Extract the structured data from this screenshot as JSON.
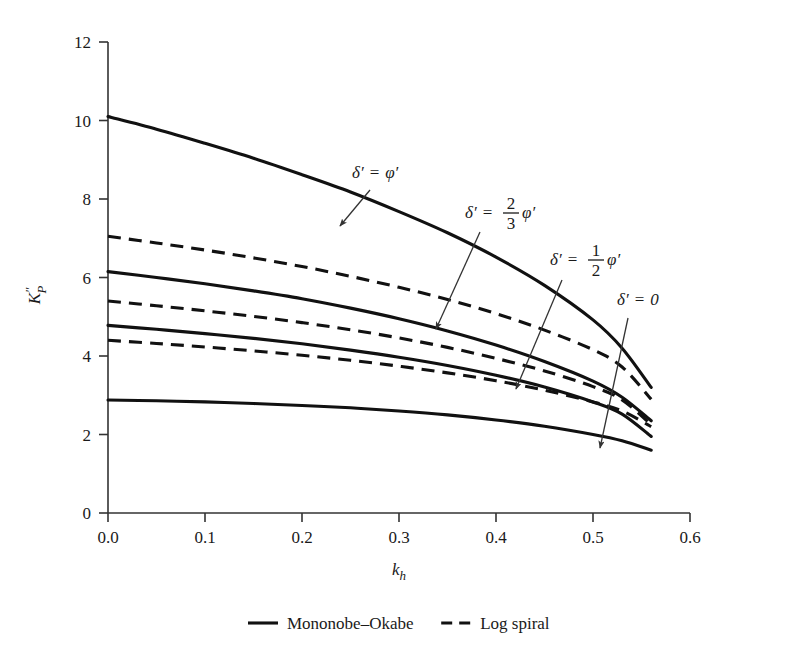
{
  "chart_data": {
    "type": "line",
    "title": "",
    "xlabel": "k_h",
    "ylabel": "K''_P",
    "xlim": [
      0.0,
      0.6
    ],
    "ylim": [
      0,
      12
    ],
    "grid": false,
    "xticks": [
      "0.0",
      "0.1",
      "0.2",
      "0.3",
      "0.4",
      "0.5",
      "0.6"
    ],
    "xtick_values": [
      0.0,
      0.1,
      0.2,
      0.3,
      0.4,
      0.5,
      0.6
    ],
    "yticks": [
      "0",
      "2",
      "4",
      "6",
      "8",
      "10",
      "12"
    ],
    "ytick_values": [
      0,
      2,
      4,
      6,
      8,
      10,
      12
    ],
    "legend_position": "bottom-outside",
    "legend": [
      {
        "label": "Mononobe–Okabe",
        "style": "solid"
      },
      {
        "label": "Log spiral",
        "style": "dashed"
      }
    ],
    "series": [
      {
        "name": "delta' = phi' (Mononobe-Okabe)",
        "style": "solid",
        "group": "delta' = phi'",
        "x": [
          0.0,
          0.05,
          0.1,
          0.15,
          0.2,
          0.25,
          0.3,
          0.35,
          0.4,
          0.45,
          0.5,
          0.53,
          0.56
        ],
        "y": [
          10.1,
          9.78,
          9.42,
          9.04,
          8.62,
          8.18,
          7.68,
          7.14,
          6.52,
          5.8,
          4.92,
          4.2,
          3.2
        ]
      },
      {
        "name": "delta' = phi' (Log spiral)",
        "style": "dashed",
        "group": "delta' = phi'",
        "x": [
          0.0,
          0.05,
          0.1,
          0.15,
          0.2,
          0.25,
          0.3,
          0.35,
          0.4,
          0.45,
          0.5,
          0.53,
          0.56
        ],
        "y": [
          7.05,
          6.88,
          6.7,
          6.5,
          6.28,
          6.03,
          5.75,
          5.44,
          5.08,
          4.66,
          4.16,
          3.72,
          2.9
        ]
      },
      {
        "name": "delta' = 2/3 phi' (Mononobe-Okabe)",
        "style": "solid",
        "group": "delta' = 2/3 phi'",
        "x": [
          0.0,
          0.05,
          0.1,
          0.15,
          0.2,
          0.25,
          0.3,
          0.35,
          0.4,
          0.45,
          0.5,
          0.53,
          0.56
        ],
        "y": [
          6.15,
          6.0,
          5.84,
          5.66,
          5.46,
          5.22,
          4.95,
          4.64,
          4.28,
          3.86,
          3.36,
          2.95,
          2.35
        ]
      },
      {
        "name": "delta' = 2/3 phi' (Log spiral)",
        "style": "dashed",
        "group": "delta' = 2/3 phi'",
        "x": [
          0.0,
          0.05,
          0.1,
          0.15,
          0.2,
          0.25,
          0.3,
          0.35,
          0.4,
          0.45,
          0.5,
          0.53,
          0.56
        ],
        "y": [
          5.4,
          5.28,
          5.15,
          5.01,
          4.85,
          4.67,
          4.46,
          4.22,
          3.94,
          3.62,
          3.22,
          2.88,
          2.25
        ]
      },
      {
        "name": "delta' = 1/2 phi' (Mononobe-Okabe)",
        "style": "solid",
        "group": "delta' = 1/2 phi'",
        "x": [
          0.0,
          0.05,
          0.1,
          0.15,
          0.2,
          0.25,
          0.3,
          0.35,
          0.4,
          0.45,
          0.5,
          0.53,
          0.56
        ],
        "y": [
          4.78,
          4.68,
          4.57,
          4.45,
          4.31,
          4.15,
          3.97,
          3.76,
          3.51,
          3.21,
          2.83,
          2.52,
          1.95
        ]
      },
      {
        "name": "delta' = 1/2 phi' (Log spiral)",
        "style": "dashed",
        "group": "delta' = 1/2 phi'",
        "x": [
          0.0,
          0.05,
          0.1,
          0.15,
          0.2,
          0.25,
          0.3,
          0.35,
          0.4,
          0.45,
          0.5,
          0.53,
          0.56
        ],
        "y": [
          4.4,
          4.32,
          4.23,
          4.13,
          4.02,
          3.89,
          3.74,
          3.57,
          3.37,
          3.13,
          2.83,
          2.6,
          2.2
        ]
      },
      {
        "name": "delta' = 0 (Mononobe-Okabe)",
        "style": "solid",
        "group": "delta' = 0",
        "x": [
          0.0,
          0.05,
          0.1,
          0.15,
          0.2,
          0.25,
          0.3,
          0.35,
          0.4,
          0.45,
          0.5,
          0.53,
          0.56
        ],
        "y": [
          2.88,
          2.86,
          2.83,
          2.79,
          2.74,
          2.68,
          2.6,
          2.5,
          2.37,
          2.21,
          2.0,
          1.84,
          1.6
        ]
      }
    ],
    "annotations": [
      {
        "id": "ann-delta-phi",
        "text": "δ′ = φ′",
        "kind": "plain",
        "label_x": 352,
        "label_y": 178,
        "arrow_from_x": 370,
        "arrow_from_y": 190,
        "arrow_to_x": 340,
        "arrow_to_y": 226
      },
      {
        "id": "ann-delta-2-3-phi",
        "text": "δ′ = 2/3 φ′",
        "kind": "fraction",
        "numerator": "2",
        "denominator": "3",
        "label_x": 465,
        "label_y": 218,
        "arrow_from_x": 480,
        "arrow_from_y": 232,
        "arrow_to_x": 436,
        "arrow_to_y": 329
      },
      {
        "id": "ann-delta-1-2-phi",
        "text": "δ′ = 1/2 φ′",
        "kind": "fraction",
        "numerator": "1",
        "denominator": "2",
        "label_x": 550,
        "label_y": 265,
        "arrow_from_x": 562,
        "arrow_from_y": 280,
        "arrow_to_x": 516,
        "arrow_to_y": 389
      },
      {
        "id": "ann-delta-0",
        "text": "δ′ = 0",
        "kind": "plain",
        "label_x": 617,
        "label_y": 305,
        "arrow_from_x": 628,
        "arrow_from_y": 318,
        "arrow_to_x": 600,
        "arrow_to_y": 448
      }
    ]
  },
  "colors": {
    "ink": "#111111",
    "axis": "#333333",
    "background": "#ffffff"
  }
}
